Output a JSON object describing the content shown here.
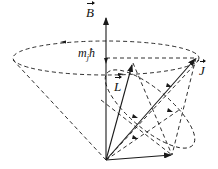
{
  "diagram": {
    "labels": {
      "B": "B",
      "mj_m": "m",
      "mj_sub": "j",
      "hbar": "ħ",
      "J": "J",
      "L": "L"
    },
    "colors": {
      "stroke": "#1a1a1a",
      "background": "#ffffff"
    },
    "geometry": {
      "origin": [
        106,
        160
      ],
      "B_tip": [
        106,
        18
      ],
      "big_ellipse": {
        "cx": 106,
        "cy": 58,
        "rx": 93,
        "ry": 17
      },
      "J_tip": [
        196,
        58
      ],
      "L_tip": [
        133,
        63
      ],
      "S_tip": [
        172,
        155
      ],
      "small_ellipse": {
        "cx": 150,
        "cy": 109,
        "rx": 55,
        "ry": 22,
        "rotate": 40
      }
    }
  }
}
